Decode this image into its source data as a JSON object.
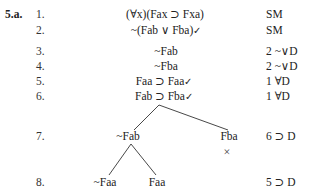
{
  "exercise_label": "5.a.",
  "lines": [
    {
      "num": "1.",
      "formula": "(∀x)(Fax ⊃ Fxa)",
      "checked": "",
      "justification": "SM"
    },
    {
      "num": "2.",
      "formula": "~(Fab ∨ Fba)",
      "checked": "✓",
      "justification": "SM"
    },
    {
      "num": "3.",
      "formula": "~Fab",
      "checked": "",
      "justification": "2  ~∨D"
    },
    {
      "num": "4.",
      "formula": "~Fba",
      "checked": "",
      "justification": "2  ~∨D"
    },
    {
      "num": "5.",
      "formula": "Faa ⊃ Faa",
      "checked": "✓",
      "justification": "1 ∀D"
    },
    {
      "num": "6.",
      "formula": "Fab ⊃ Fba",
      "checked": "✓",
      "justification": "1 ∀D"
    },
    {
      "num": "7.",
      "branches": [
        "~Fab",
        "Fba"
      ],
      "closed_branch_marker": "×",
      "justification": "6  ⊃ D"
    },
    {
      "num": "8.",
      "branches": [
        "~Faa",
        "Faa"
      ],
      "justification": "5  ⊃ D"
    }
  ],
  "tree": {
    "line_color": "#333333"
  }
}
